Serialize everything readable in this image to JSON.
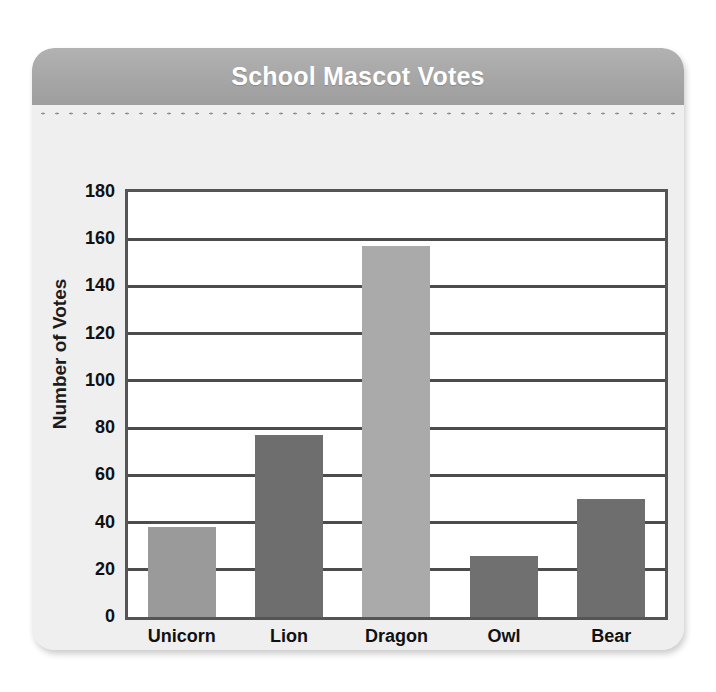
{
  "card": {
    "title": "School Mascot Votes"
  },
  "chart_data": {
    "type": "bar",
    "title": "School Mascot Votes",
    "xlabel": "Mascot",
    "ylabel": "Number of Votes",
    "categories": [
      "Unicorn",
      "Lion",
      "Dragon",
      "Owl",
      "Bear"
    ],
    "values": [
      38,
      77,
      157,
      26,
      50
    ],
    "bar_colors": [
      "#9a9a9a",
      "#6e6e6e",
      "#aaaaaa",
      "#707070",
      "#6e6e6e"
    ],
    "ylim": [
      0,
      180
    ],
    "ytick_labels": [
      "180",
      "160",
      "140",
      "120",
      "100",
      "80",
      "60",
      "40",
      "20",
      "0"
    ],
    "ytick_values": [
      180,
      160,
      140,
      120,
      100,
      80,
      60,
      40,
      20,
      0
    ],
    "ytick_step": 20,
    "gridlines": [
      160,
      140,
      120,
      100,
      80,
      60,
      40,
      20
    ],
    "grid": true,
    "legend": "none",
    "plot_bg": "#ffffff",
    "frame_color": "#555555",
    "gridline_color": "#4c4c4c"
  }
}
